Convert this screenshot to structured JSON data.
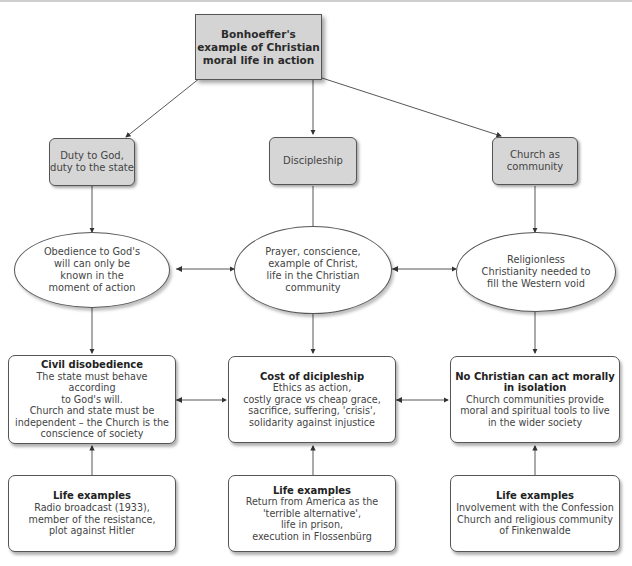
{
  "title": "Bonhoeffer's\nexample of Christian\nmoral life in action",
  "themes": [
    {
      "label": "Duty to God,\nduty to the state"
    },
    {
      "label": "Discipleship"
    },
    {
      "label": "Church as\ncommunity"
    }
  ],
  "ideas": [
    {
      "text": "Obedience to God's\nwill can only be\nknown in the\nmoment of action"
    },
    {
      "text": "Prayer, conscience,\nexample of Christ,\nlife in the Christian\ncommunity"
    },
    {
      "text": "Religionless\nChristianity needed to\nfill the Western void"
    }
  ],
  "concepts": [
    {
      "title": "Civil disobedience",
      "body": "The state must behave according\nto God's will.\nChurch and state must be\nindependent – the Church is the\nconscience of society"
    },
    {
      "title": "Cost of dicipleship",
      "body": "Ethics as action,\ncostly grace vs cheap grace,\nsacrifice, suffering, 'crisis',\nsolidarity against injustice"
    },
    {
      "title": "No Christian can act morally\nin isolation",
      "body": "Church communities provide\nmoral and spiritual tools to live\nin the wider society"
    }
  ],
  "life_examples": [
    {
      "title": "Life examples",
      "body": "Radio broadcast (1933),\nmember of the resistance,\nplot against Hitler"
    },
    {
      "title": "Life examples",
      "body": "Return from America as the\n'terrible alternative',\nlife in prison,\nexecution in Flossenbürg"
    },
    {
      "title": "Life examples",
      "body": "Involvement with the Confession\nChurch and religious community\nof Finkenwalde"
    }
  ],
  "colors": {
    "root_fill": "#d4d4d4",
    "theme_fill": "#d6d6d6",
    "stroke": "#555555",
    "background": "#ffffff"
  }
}
